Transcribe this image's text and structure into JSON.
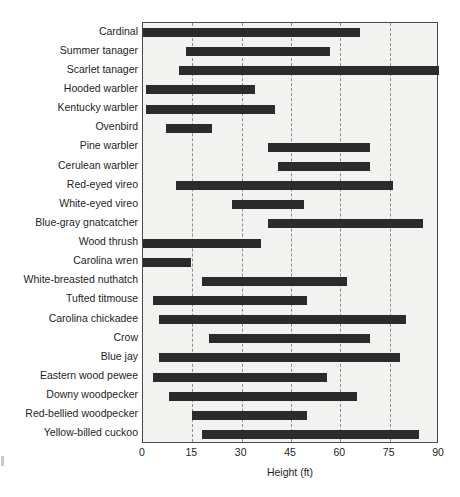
{
  "chart_data": {
    "type": "bar",
    "orientation": "horizontal",
    "bar_style": "range",
    "title": "",
    "xlabel": "Height (ft)",
    "ylabel": "",
    "xlim": [
      0,
      90
    ],
    "xticks": [
      0,
      15,
      30,
      45,
      60,
      75,
      90
    ],
    "xtick_labels": [
      "0",
      "15",
      "30",
      "45",
      "60",
      "75",
      "90"
    ],
    "gridlines": {
      "x": [
        15,
        30,
        45,
        60,
        75
      ],
      "style": "dashed",
      "y": false
    },
    "legend": null,
    "categories": [
      "Cardinal",
      "Summer tanager",
      "Scarlet tanager",
      "Hooded warbler",
      "Kentucky warbler",
      "Ovenbird",
      "Pine warbler",
      "Cerulean warbler",
      "Red-eyed vireo",
      "White-eyed vireo",
      "Blue-gray gnatcatcher",
      "Wood thrush",
      "Carolina wren",
      "White-breasted nuthatch",
      "Tufted titmouse",
      "Carolina chickadee",
      "Crow",
      "Blue jay",
      "Eastern wood pewee",
      "Downy woodpecker",
      "Red-bellied woodpecker",
      "Yellow-billed cuckoo"
    ],
    "ranges": [
      {
        "label": "Cardinal",
        "low": 0,
        "high": 66
      },
      {
        "label": "Summer tanager",
        "low": 13,
        "high": 57
      },
      {
        "label": "Scarlet tanager",
        "low": 11,
        "high": 90
      },
      {
        "label": "Hooded warbler",
        "low": 1,
        "high": 34
      },
      {
        "label": "Kentucky warbler",
        "low": 1,
        "high": 40
      },
      {
        "label": "Ovenbird",
        "low": 7,
        "high": 21
      },
      {
        "label": "Pine warbler",
        "low": 38,
        "high": 69
      },
      {
        "label": "Cerulean warbler",
        "low": 41,
        "high": 69
      },
      {
        "label": "Red-eyed vireo",
        "low": 10,
        "high": 76
      },
      {
        "label": "White-eyed vireo",
        "low": 27,
        "high": 49
      },
      {
        "label": "Blue-gray gnatcatcher",
        "low": 38,
        "high": 85
      },
      {
        "label": "Wood thrush",
        "low": 0,
        "high": 36
      },
      {
        "label": "Carolina wren",
        "low": 0,
        "high": 14.5
      },
      {
        "label": "White-breasted nuthatch",
        "low": 18,
        "high": 62
      },
      {
        "label": "Tufted titmouse",
        "low": 3,
        "high": 50
      },
      {
        "label": "Carolina chickadee",
        "low": 5,
        "high": 80
      },
      {
        "label": "Crow",
        "low": 20,
        "high": 69
      },
      {
        "label": "Blue jay",
        "low": 5,
        "high": 78
      },
      {
        "label": "Eastern wood pewee",
        "low": 3,
        "high": 56
      },
      {
        "label": "Downy woodpecker",
        "low": 8,
        "high": 65
      },
      {
        "label": "Red-bellied woodpecker",
        "low": 15,
        "high": 50
      },
      {
        "label": "Yellow-billed cuckoo",
        "low": 18,
        "high": 84
      }
    ],
    "colors": {
      "bar": "#2b2b2b",
      "plot_background": "#f2f2f0",
      "grid": "#8d8d8d",
      "frame": "#4a4a4a",
      "text": "#1e1e1e"
    }
  }
}
